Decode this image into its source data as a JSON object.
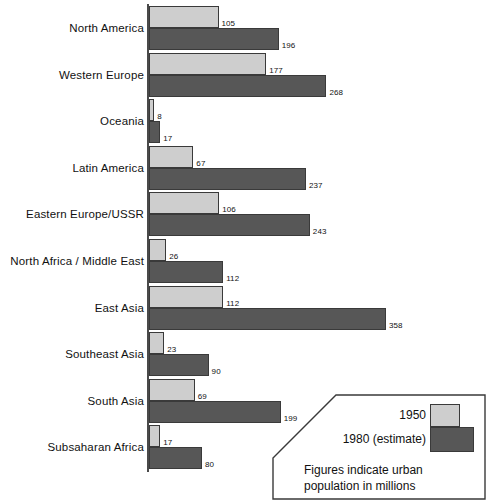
{
  "chart_data": {
    "type": "bar",
    "title": "",
    "subtitle": "",
    "xlabel": "",
    "ylabel": "",
    "orientation": "horizontal",
    "grid": false,
    "xlim": [
      0,
      358
    ],
    "categories": [
      "North America",
      "Western Europe",
      "Oceania",
      "Latin America",
      "Eastern Europe/USSR",
      "North Africa / Middle East",
      "East Asia",
      "Southeast Asia",
      "South Asia",
      "Subsaharan Africa"
    ],
    "series": [
      {
        "name": "1950",
        "color": "#cecece",
        "values": [
          105,
          177,
          8,
          67,
          106,
          26,
          112,
          23,
          69,
          17
        ]
      },
      {
        "name": "1980 (estimate)",
        "color": "#575757",
        "values": [
          196,
          268,
          17,
          237,
          243,
          112,
          358,
          90,
          199,
          80
        ]
      }
    ],
    "legend_position": "bottom-right",
    "annotations": [
      "Figures indicate urban\npopulation in millions"
    ]
  },
  "legend": {
    "series_1950_label": "1950",
    "series_1980_label": "1980 (estimate)",
    "note": "Figures indicate urban\npopulation in millions"
  }
}
